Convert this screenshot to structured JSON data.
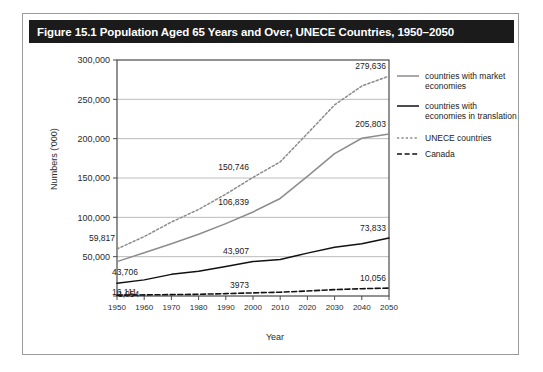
{
  "figure": {
    "title": "Figure 15.1 Population Aged 65 Years and Over, UNECE Countries, 1950–2050"
  },
  "chart_data": {
    "type": "line",
    "title": "Figure 15.1 Population Aged 65 Years and Over, UNECE Countries, 1950–2050",
    "xlabel": "Year",
    "ylabel": "Numbers ('000)",
    "xlim": [
      1950,
      2050
    ],
    "ylim": [
      0,
      300000
    ],
    "grid": true,
    "legend_position": "right",
    "x": [
      1950,
      1960,
      1970,
      1980,
      1990,
      2000,
      2010,
      2020,
      2030,
      2040,
      2050
    ],
    "ytick_labels": [
      "0",
      "50,000",
      "100,000",
      "150,000",
      "200,000",
      "250,000",
      "300,000"
    ],
    "ytick_values": [
      0,
      50000,
      100000,
      150000,
      200000,
      250000,
      300000
    ],
    "xtick_labels": [
      "1950",
      "1960",
      "1970",
      "1980",
      "1990",
      "2000",
      "2010",
      "2020",
      "2030",
      "2040",
      "2050"
    ],
    "series": [
      {
        "name": "countries with market economies",
        "style": "solid",
        "color": "#8c8c8c",
        "values": [
          43706,
          55000,
          66500,
          78500,
          92000,
          106839,
          124000,
          152000,
          181000,
          200500,
          205803
        ]
      },
      {
        "name": "countries with economies in translation",
        "style": "solid",
        "color": "#111111",
        "values": [
          16111,
          20500,
          27500,
          31500,
          37500,
          43907,
          46500,
          54500,
          62000,
          66500,
          73833
        ]
      },
      {
        "name": "UNECE countries",
        "style": "dotted",
        "color": "#8c8c8c",
        "values": [
          59817,
          75500,
          94000,
          110000,
          129500,
          150746,
          170500,
          206500,
          243000,
          267000,
          279636
        ]
      },
      {
        "name": "Canada",
        "style": "dashed",
        "color": "#111111",
        "values": [
          1054,
          1400,
          1750,
          2200,
          3000,
          3973,
          4800,
          6400,
          8100,
          9300,
          10056
        ]
      }
    ],
    "annotations": [
      {
        "text": "59,817",
        "series": "UNECE countries",
        "x": 1950
      },
      {
        "text": "43,706",
        "series": "countries with market economies",
        "x": 1950
      },
      {
        "text": "16,111",
        "series": "countries with economies in translation",
        "x": 1950
      },
      {
        "text": "1,054",
        "series": "Canada",
        "x": 1950
      },
      {
        "text": "150,746",
        "series": "UNECE countries",
        "x": 2000
      },
      {
        "text": "106,839",
        "series": "countries with market economies",
        "x": 2000
      },
      {
        "text": "43,907",
        "series": "countries with economies in translation",
        "x": 2000
      },
      {
        "text": "3973",
        "series": "Canada",
        "x": 2000
      },
      {
        "text": "279,636",
        "series": "UNECE countries",
        "x": 2050
      },
      {
        "text": "205,803",
        "series": "countries with market economies",
        "x": 2050
      },
      {
        "text": "73,833",
        "series": "countries with economies in translation",
        "x": 2050
      },
      {
        "text": "10,056",
        "series": "Canada",
        "x": 2050
      }
    ]
  },
  "legend": {
    "items": [
      {
        "label_line1": "countries with market",
        "label_line2": "economies"
      },
      {
        "label_line1": "countries with",
        "label_line2": "economies in translation"
      },
      {
        "label_line1": "UNECE countries",
        "label_line2": ""
      },
      {
        "label_line1": "Canada",
        "label_line2": ""
      }
    ]
  }
}
